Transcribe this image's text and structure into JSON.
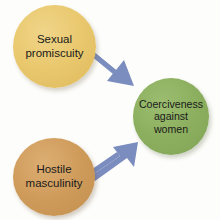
{
  "diagram": {
    "type": "flow-diagram",
    "background_color": "#fdfdfb",
    "nodes": [
      {
        "id": "promiscuity",
        "label": "Sexual\npromiscuity",
        "shape": "circle",
        "color": "#e9c86e",
        "role": "predictor",
        "position": "top-left"
      },
      {
        "id": "masculinity",
        "label": "Hostile\nmasculinity",
        "shape": "circle",
        "color": "#cf9b5b",
        "role": "predictor",
        "position": "bottom-left"
      },
      {
        "id": "coerciveness",
        "label": "Coerciveness\nagainst\nwomen",
        "shape": "circle",
        "color": "#8caf5f",
        "role": "outcome",
        "position": "right-center"
      }
    ],
    "arrows": [
      {
        "id": "arrow-promiscuity-to-coerciveness",
        "from": "promiscuity",
        "to": "coerciveness",
        "direction": "down-right",
        "color": "#7b8cbe"
      },
      {
        "id": "arrow-masculinity-to-coerciveness",
        "from": "masculinity",
        "to": "coerciveness",
        "direction": "up-right",
        "color": "#7b8cbe"
      }
    ]
  }
}
